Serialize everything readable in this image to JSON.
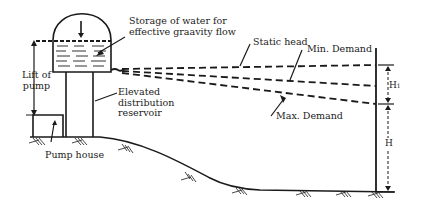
{
  "diagram": {
    "type": "elevated-reservoir-hydraulic-gradient",
    "labels": {
      "storage": [
        "Storage of water for",
        "effective graavity flow"
      ],
      "lift": [
        "Lift of",
        "pump"
      ],
      "elevated": [
        "Elevated",
        "distribution",
        "reservoir"
      ],
      "pump_house": "Pump house",
      "static_head": "Static head",
      "min_demand": "Min. Demand",
      "max_demand": "Max. Demand",
      "h1": "H",
      "h1_sub": "1",
      "h": "H"
    },
    "lines": [
      {
        "name": "Static head",
        "style": "dashed"
      },
      {
        "name": "Min. Demand",
        "style": "dashed"
      },
      {
        "name": "Max. Demand",
        "style": "dashed"
      }
    ],
    "colors": {
      "ink": "#1a1a1a",
      "background": "#ffffff"
    }
  }
}
